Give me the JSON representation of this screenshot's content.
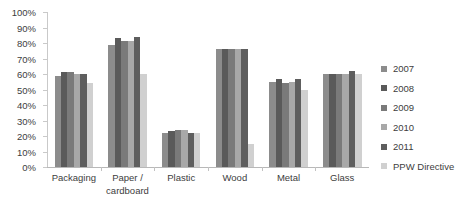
{
  "chart_data": {
    "type": "bar",
    "title": "",
    "subtitle": "",
    "xlabel": "",
    "ylabel": "",
    "ylim": [
      0,
      100
    ],
    "ytick_labels": [
      "100%",
      "90%",
      "80%",
      "70%",
      "60%",
      "50%",
      "40%",
      "30%",
      "20%",
      "10%",
      "0%"
    ],
    "ytick_values": [
      100,
      90,
      80,
      70,
      60,
      50,
      40,
      30,
      20,
      10,
      0
    ],
    "grid": false,
    "legend_position": "right",
    "categories": [
      "Packaging",
      "Paper /\ncardboard",
      "Plastic",
      "Wood",
      "Metal",
      "Glass"
    ],
    "category_labels": [
      {
        "line1": "Packaging",
        "line2": ""
      },
      {
        "line1": "Paper /",
        "line2": "cardboard"
      },
      {
        "line1": "Plastic",
        "line2": ""
      },
      {
        "line1": "Wood",
        "line2": ""
      },
      {
        "line1": "Metal",
        "line2": ""
      },
      {
        "line1": "Glass",
        "line2": ""
      }
    ],
    "series": [
      {
        "name": "2007",
        "color": "#8c8c8c",
        "values": [
          59,
          79,
          22,
          76,
          55,
          60
        ]
      },
      {
        "name": "2008",
        "color": "#5a5a5a",
        "values": [
          61,
          83,
          23,
          76,
          57,
          60
        ]
      },
      {
        "name": "2009",
        "color": "#7a7a7a",
        "values": [
          61,
          81,
          24,
          76,
          54,
          60
        ]
      },
      {
        "name": "2010",
        "color": "#a8a8a8",
        "values": [
          60,
          81,
          24,
          76,
          55,
          60
        ]
      },
      {
        "name": "2011",
        "color": "#5e5e5e",
        "values": [
          60,
          84,
          22,
          76,
          57,
          62
        ]
      },
      {
        "name": "PPW Directive",
        "color": "#d0d0d0",
        "values": [
          54,
          60,
          22,
          15,
          50,
          60
        ]
      }
    ]
  },
  "legend": {
    "items": [
      {
        "label": "2007",
        "color": "#8c8c8c"
      },
      {
        "label": "2008",
        "color": "#5a5a5a"
      },
      {
        "label": "2009",
        "color": "#7a7a7a"
      },
      {
        "label": "2010",
        "color": "#a8a8a8"
      },
      {
        "label": "2011",
        "color": "#5e5e5e"
      },
      {
        "label": "PPW Directive",
        "color": "#d0d0d0"
      }
    ]
  },
  "colors": {
    "axis": "#c0c0c0",
    "text": "#3d3d3d",
    "background": "#ffffff"
  }
}
